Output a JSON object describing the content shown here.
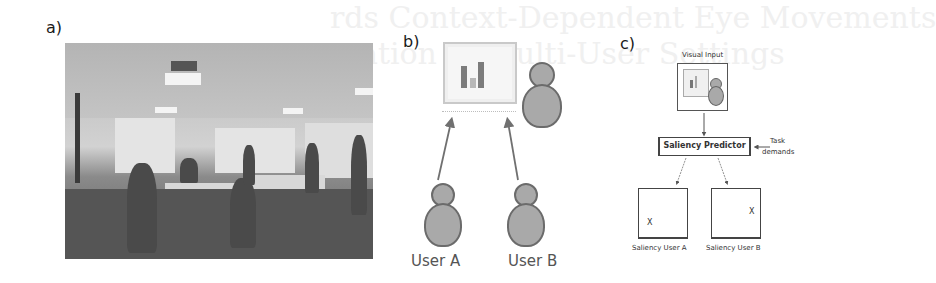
{
  "background_text": [
    "rds Context-Dependent Eye Movements",
    "ation in Multi-User Settings"
  ],
  "panels": {
    "a": {
      "label": "a)",
      "content": "photo of a classroom / meeting room with people seated at tables facing projection screens"
    },
    "b": {
      "label": "b)",
      "icons": [
        "monitor-with-bar-chart-icon",
        "presenter-person-icon",
        "user-a-person-icon",
        "user-b-person-icon"
      ],
      "users": [
        {
          "label": "User A"
        },
        {
          "label": "User B"
        }
      ]
    },
    "c": {
      "label": "c)",
      "visual_input_label": "Visual Input",
      "predictor_label": "Saliency Predictor",
      "task_label_line1": "Task",
      "task_label_line2": "demands",
      "outputs": [
        {
          "label": "Saliency User A",
          "marker": "X"
        },
        {
          "label": "Saliency User B",
          "marker": "X"
        }
      ]
    }
  },
  "colors": {
    "person_fill": "#a9a9a9",
    "person_stroke": "#6b6b6b",
    "arrow": "#707070",
    "box_border": "#444444"
  }
}
